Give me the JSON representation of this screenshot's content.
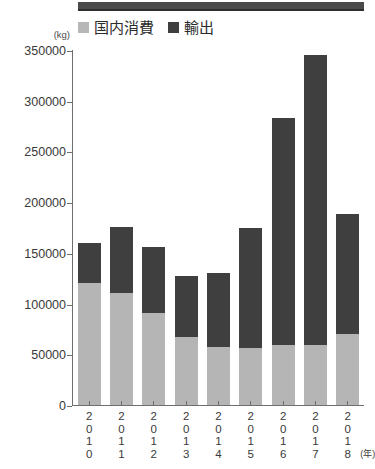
{
  "decoration": {
    "top_bar_color": "#4a4a4a"
  },
  "chart_data": {
    "type": "bar",
    "subtype": "stacked-vertical",
    "title": "",
    "subtitle": "",
    "xlabel": "(年)",
    "ylabel": "",
    "yunit": "(kg)",
    "ylim": [
      0,
      350000
    ],
    "ytick_interval": 50000,
    "ytick_labels": [
      "350000",
      "300000",
      "250000",
      "200000",
      "150000",
      "100000",
      "50000",
      "0"
    ],
    "ytick_values": [
      350000,
      300000,
      250000,
      200000,
      150000,
      100000,
      50000,
      0
    ],
    "grid": false,
    "legend_position": "top-left",
    "categories": [
      "2010",
      "2011",
      "2012",
      "2013",
      "2014",
      "2015",
      "2016",
      "2017",
      "2018"
    ],
    "series": [
      {
        "name": "国内消費",
        "color": "#b5b5b5",
        "values": [
          120000,
          110000,
          91000,
          67000,
          57000,
          56000,
          59000,
          59000,
          70000
        ]
      },
      {
        "name": "輸出",
        "color": "#3f3f3f",
        "values": [
          40000,
          66000,
          65000,
          60000,
          73000,
          119000,
          224000,
          286000,
          118000
        ]
      }
    ],
    "totals": [
      160000,
      176000,
      156000,
      127000,
      130000,
      175000,
      283000,
      345000,
      188000
    ]
  }
}
